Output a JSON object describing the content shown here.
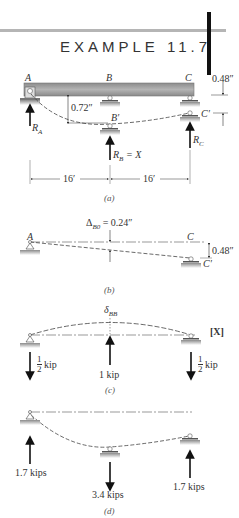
{
  "header": {
    "title": "EXAMPLE 11.7",
    "rule_color": "#b5b5b5",
    "bar_color": "#111111"
  },
  "figure_a": {
    "caption": "(a)",
    "points": {
      "A": "A",
      "B": "B",
      "C": "C",
      "B_prime": "B′",
      "C_prime": "C′"
    },
    "dim_top_right": "0.48″",
    "dim_B_deflection": "0.72″",
    "reactions": {
      "RA": "R",
      "RA_sub": "A",
      "RB": "R",
      "RB_sub": "B",
      "RB_eq": " = X",
      "RC": "R",
      "RC_sub": "C"
    },
    "spans": [
      "16′",
      "16′"
    ],
    "beam_color": "#9a9a9a"
  },
  "figure_b": {
    "caption": "(b)",
    "delta_label": "Δ",
    "delta_sub": "B0",
    "delta_value": " = 0.24″",
    "points": {
      "A": "A",
      "C": "C",
      "C_prime": "C′"
    },
    "dim_settlement": "0.48″"
  },
  "figure_c": {
    "caption": "(c)",
    "delta_label": "δ",
    "delta_sub": "BB",
    "redundant": "[X]",
    "loads": {
      "left_num": "1",
      "left_den": "2",
      "left_unit": "kip",
      "center": "1 kip",
      "right_num": "1",
      "right_den": "2",
      "right_unit": "kip"
    }
  },
  "figure_d": {
    "caption": "(d)",
    "loads": {
      "left": "1.7 kips",
      "center": "3.4 kips",
      "right": "1.7 kips"
    }
  }
}
